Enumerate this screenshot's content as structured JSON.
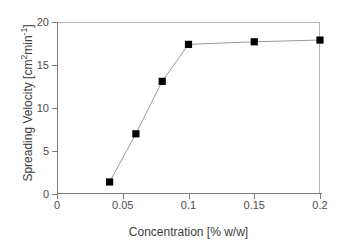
{
  "chart_data": {
    "type": "line",
    "title": "",
    "subtitle": "",
    "xlabel": "Concentration [% w/w]",
    "ylabel": "Spreading Velocity [cm2min-1]",
    "ylabel_parts": {
      "prefix": "Spreading Velocity [cm",
      "sup1": "2",
      "mid": "min",
      "sup2": "-1",
      "suffix": "]"
    },
    "xlim": [
      0,
      0.2
    ],
    "ylim": [
      0,
      20
    ],
    "xticks": [
      0,
      0.05,
      0.1,
      0.15,
      0.2
    ],
    "xtick_labels": [
      "0",
      "0.05",
      "0.1",
      "0.15",
      "0.2"
    ],
    "yticks": [
      0,
      5,
      10,
      15,
      20
    ],
    "ytick_labels": [
      "0",
      "5",
      "10",
      "15",
      "20"
    ],
    "grid": false,
    "legend": null,
    "legend_position": "none",
    "marker": "filled-square",
    "marker_color": "#000000",
    "line_color": "#9a9a9a",
    "frame_color": "#b8b8b8",
    "axis_color": "#7a7a7a",
    "x": [
      0.04,
      0.06,
      0.08,
      0.1,
      0.15,
      0.2
    ],
    "values": [
      1.4,
      7.0,
      13.1,
      17.4,
      17.7,
      17.9
    ],
    "series": [
      {
        "name": "Spreading Velocity",
        "x": [
          0.04,
          0.06,
          0.08,
          0.1,
          0.15,
          0.2
        ],
        "values": [
          1.4,
          7.0,
          13.1,
          17.4,
          17.7,
          17.9
        ]
      }
    ],
    "annotations": []
  }
}
